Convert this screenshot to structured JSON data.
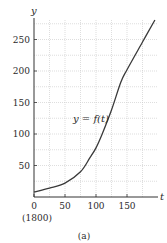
{
  "chart_data": {
    "type": "line",
    "title": "",
    "caption": "(a)",
    "xlabel": "t",
    "ylabel": "y",
    "x_origin_note": "(1800)",
    "xlim": [
      0,
      200
    ],
    "ylim": [
      0,
      280
    ],
    "x_ticks": [
      0,
      50,
      100,
      150
    ],
    "x_tick_labels": [
      "0",
      "50",
      "100",
      "150"
    ],
    "y_ticks": [
      50,
      100,
      150,
      200,
      250
    ],
    "y_tick_labels": [
      "50",
      "100",
      "150",
      "200",
      "250"
    ],
    "grid": {
      "on": true,
      "style": "dotted",
      "x_step": 25,
      "y_step": 25
    },
    "legend": null,
    "annotations": [
      {
        "text": "y = f(t)",
        "x": 118,
        "y": 148
      }
    ],
    "series": [
      {
        "name": "y = f(t)",
        "x": [
          0,
          25,
          50,
          75,
          90,
          100,
          110,
          125,
          140,
          150,
          175,
          195
        ],
        "values": [
          8,
          14,
          22,
          40,
          62,
          78,
          100,
          138,
          182,
          202,
          246,
          281
        ]
      }
    ]
  },
  "labels": {
    "y_axis": "y",
    "x_axis": "t",
    "origin_year": "(1800)",
    "curve": "y = f(t)",
    "caption": "(a)"
  }
}
